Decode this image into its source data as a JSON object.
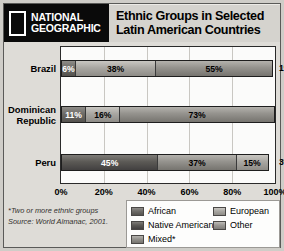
{
  "header": {
    "logo_line1": "NATIONAL",
    "logo_line2": "GEOGRAPHIC",
    "logo_icon": "national-geographic-rectangle",
    "title_line1": "Ethnic Groups in Selected",
    "title_line2": "Latin American Countries"
  },
  "footnote": {
    "line1": "*Two or more ethnic groups",
    "line2": "Source: World Almanac, 2001."
  },
  "legend": {
    "items": [
      {
        "label": "African",
        "key": "african",
        "color": "#6e6c68"
      },
      {
        "label": "European",
        "key": "european",
        "color": "#a9a7a2"
      },
      {
        "label": "Native American",
        "key": "native",
        "color": "#5c5a56"
      },
      {
        "label": "Other",
        "key": "other",
        "color": "#9a9894"
      },
      {
        "label": "Mixed*",
        "key": "mixed",
        "color": "#94928d"
      }
    ]
  },
  "chart_data": {
    "type": "bar",
    "orientation": "horizontal",
    "stacked": true,
    "title": "Ethnic Groups in Selected Latin American Countries",
    "xlabel": "",
    "ylabel": "",
    "xlim": [
      0,
      100
    ],
    "xticks": [
      "0%",
      "20%",
      "40%",
      "60%",
      "80%",
      "100%"
    ],
    "xtick_values": [
      0,
      20,
      40,
      60,
      80,
      100
    ],
    "grid": true,
    "legend_position": "bottom-right",
    "categories": [
      "Brazil",
      "Dominican Republic",
      "Peru"
    ],
    "series": [
      {
        "name": "African",
        "values": [
          6,
          11,
          null
        ]
      },
      {
        "name": "European",
        "values": [
          38,
          16,
          null
        ]
      },
      {
        "name": "Mixed*",
        "values": [
          55,
          73,
          37
        ]
      },
      {
        "name": "Native American",
        "values": [
          null,
          null,
          45
        ]
      },
      {
        "name": "Other",
        "values": [
          1,
          null,
          3
        ]
      },
      {
        "name": "Unlabeled",
        "values": [
          null,
          null,
          15
        ]
      }
    ],
    "bars": [
      {
        "country": "Brazil",
        "label_lines": [
          "Brazil"
        ],
        "segments": [
          {
            "group": "African",
            "key": "african",
            "value": 6,
            "label": "6%",
            "inside": true
          },
          {
            "group": "European",
            "key": "european",
            "value": 38,
            "label": "38%",
            "inside": true
          },
          {
            "group": "Mixed*",
            "key": "mixed",
            "value": 55,
            "label": "55%",
            "inside": true
          },
          {
            "group": "Other",
            "key": "other",
            "value": 1,
            "label": "1%",
            "inside": false
          }
        ]
      },
      {
        "country": "Dominican Republic",
        "label_lines": [
          "Dominican",
          "Republic"
        ],
        "segments": [
          {
            "group": "African",
            "key": "african",
            "value": 11,
            "label": "11%",
            "inside": true
          },
          {
            "group": "European",
            "key": "european",
            "value": 16,
            "label": "16%",
            "inside": true
          },
          {
            "group": "Mixed*",
            "key": "mixed",
            "value": 73,
            "label": "73%",
            "inside": true
          }
        ]
      },
      {
        "country": "Peru",
        "label_lines": [
          "Peru"
        ],
        "segments": [
          {
            "group": "Native American",
            "key": "native",
            "value": 45,
            "label": "45%",
            "inside": true
          },
          {
            "group": "Mixed*",
            "key": "mixed",
            "value": 37,
            "label": "37%",
            "inside": true
          },
          {
            "group": "European",
            "key": "european",
            "value": 15,
            "label": "15%",
            "inside": true
          },
          {
            "group": "Other",
            "key": "other",
            "value": 3,
            "label": "3%",
            "inside": false
          }
        ]
      }
    ]
  }
}
